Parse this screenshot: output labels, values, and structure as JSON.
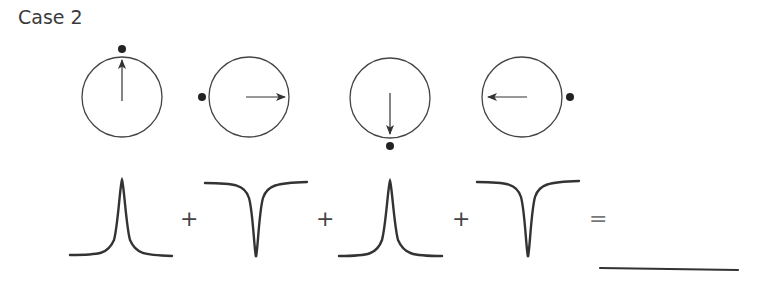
{
  "title": "Case 2",
  "colors": {
    "stroke": "#3a3a3a",
    "dot": "#222222",
    "background": "#ffffff"
  },
  "vectors": [
    {
      "id": 1,
      "direction": "up",
      "dot_position": "top"
    },
    {
      "id": 2,
      "direction": "right",
      "dot_position": "left"
    },
    {
      "id": 3,
      "direction": "down",
      "dot_position": "bottom"
    },
    {
      "id": 4,
      "direction": "left",
      "dot_position": "right"
    }
  ],
  "signals": [
    {
      "id": 1,
      "shape": "peak"
    },
    {
      "id": 2,
      "shape": "dip"
    },
    {
      "id": 3,
      "shape": "peak"
    },
    {
      "id": 4,
      "shape": "dip"
    }
  ],
  "operators": {
    "plus1": "+",
    "plus2": "+",
    "plus3": "+",
    "equals": "="
  },
  "result": {
    "shape": "flat-line",
    "label": ""
  }
}
